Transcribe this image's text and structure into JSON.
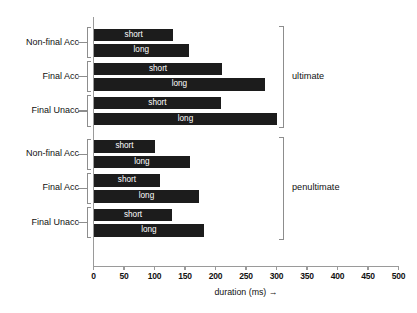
{
  "chart_data": {
    "type": "bar",
    "orientation": "horizontal",
    "title": "",
    "xlabel": "duration (ms) →",
    "ylabel": "",
    "xlim": [
      0,
      500
    ],
    "xticks": [
      0,
      50,
      100,
      150,
      200,
      250,
      300,
      350,
      400,
      450,
      500
    ],
    "xtick_labels": [
      "0",
      "50",
      "100",
      "150",
      "200",
      "250",
      "300",
      "350",
      "400",
      "450",
      "500"
    ],
    "grid": false,
    "legend": false,
    "bar_color": "#1c1c1c",
    "bar_label_color": "#ffffff",
    "axis_color": "#9a9a9a",
    "groups": [
      {
        "name": "ultimate",
        "categories": [
          {
            "label": "Non-final Acc",
            "bars": [
              {
                "label": "short",
                "value": 130
              },
              {
                "label": "long",
                "value": 155
              }
            ]
          },
          {
            "label": "Final Acc",
            "bars": [
              {
                "label": "short",
                "value": 210
              },
              {
                "label": "long",
                "value": 280
              }
            ]
          },
          {
            "label": "Final Unacc",
            "bars": [
              {
                "label": "short",
                "value": 208
              },
              {
                "label": "long",
                "value": 300
              }
            ]
          }
        ]
      },
      {
        "name": "penultimate",
        "categories": [
          {
            "label": "Non-final Acc",
            "bars": [
              {
                "label": "short",
                "value": 100
              },
              {
                "label": "long",
                "value": 157
              }
            ]
          },
          {
            "label": "Final Acc",
            "bars": [
              {
                "label": "short",
                "value": 108
              },
              {
                "label": "long",
                "value": 172
              }
            ]
          },
          {
            "label": "Final Unacc",
            "bars": [
              {
                "label": "short",
                "value": 128
              },
              {
                "label": "long",
                "value": 180
              }
            ]
          }
        ]
      }
    ]
  }
}
